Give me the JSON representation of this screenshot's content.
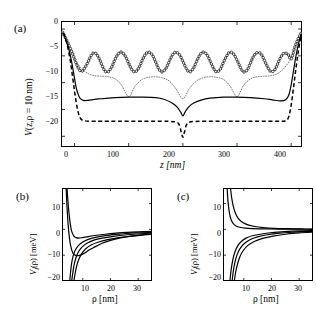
{
  "figure": {
    "panels": [
      {
        "tag": "(a)",
        "xlabel": "z [nm]",
        "ylabel_parts": {
          "v": "V",
          "args": "(z,ρ = 10 nm)"
        },
        "xticks": [
          "0",
          "100",
          "200",
          "300",
          "400"
        ],
        "yticks": [
          "0",
          "−5",
          "−10",
          "−15",
          "−20"
        ]
      },
      {
        "tag": "(b)",
        "xlabel": "ρ [nm]",
        "ylabel_parts": {
          "v": "V",
          "sub": "l",
          "args": "(ρ)",
          "unit": "[meV]"
        },
        "xticks": [
          "10",
          "20",
          "30"
        ],
        "yticks": [
          "10",
          "0",
          "−10",
          "−20"
        ],
        "annotation": "l=2…6"
      },
      {
        "tag": "(c)",
        "xlabel": "ρ [nm]",
        "ylabel_parts": {
          "v": "V",
          "sub": "l",
          "args": "(ρ)",
          "unit": "[meV]"
        },
        "xticks": [
          "10",
          "20",
          "30"
        ],
        "yticks": [
          "10",
          "0",
          "−10",
          "−20"
        ],
        "annotation": "l=2…6"
      }
    ]
  },
  "chart_data": [
    {
      "type": "line",
      "panel": "a",
      "title": "",
      "xlabel": "z [nm]",
      "ylabel": "V(z,ρ = 10 nm)",
      "xlim": [
        -25,
        420
      ],
      "ylim": [
        -22,
        1.5
      ],
      "xticks": [
        0,
        100,
        200,
        300,
        400
      ],
      "yticks": [
        0,
        -5,
        -10,
        -15,
        -20
      ],
      "grid": false,
      "legend": "none",
      "series": [
        {
          "name": "oscillating-circles",
          "style": "open-circle-markers",
          "comment": "8 oscillation periods of ~50 nm between z=0 and z=400, peaks near -4.3, troughs near -8.0; rises steeply to ~0 outside 0..400",
          "x": [
            -22,
            -18,
            -14,
            -10,
            -6,
            -2,
            0,
            6,
            12,
            18,
            25,
            31,
            37,
            44,
            50,
            56,
            62,
            69,
            75,
            81,
            87,
            94,
            100,
            106,
            112,
            119,
            125,
            131,
            137,
            144,
            150,
            156,
            162,
            169,
            175,
            181,
            187,
            194,
            200,
            206,
            212,
            219,
            225,
            231,
            237,
            244,
            250,
            256,
            262,
            269,
            275,
            281,
            287,
            294,
            300,
            306,
            312,
            319,
            325,
            331,
            337,
            344,
            350,
            356,
            362,
            369,
            375,
            381,
            387,
            394,
            400,
            406,
            412,
            418
          ],
          "y": [
            -0.6,
            -1.4,
            -2.2,
            -3.1,
            -4.0,
            -5.0,
            -5.6,
            -7.1,
            -7.9,
            -7.4,
            -6.1,
            -4.9,
            -4.4,
            -5.2,
            -6.6,
            -7.8,
            -8.0,
            -7.0,
            -5.6,
            -4.6,
            -4.3,
            -5.1,
            -6.4,
            -7.6,
            -8.0,
            -7.2,
            -5.8,
            -4.7,
            -4.3,
            -4.9,
            -6.2,
            -7.5,
            -8.0,
            -7.3,
            -6.0,
            -4.8,
            -4.3,
            -4.8,
            -6.0,
            -7.3,
            -8.0,
            -7.4,
            -6.1,
            -4.9,
            -4.3,
            -4.7,
            -5.9,
            -7.2,
            -8.0,
            -7.5,
            -6.2,
            -5.0,
            -4.3,
            -4.7,
            -5.8,
            -7.1,
            -8.0,
            -7.6,
            -6.3,
            -5.0,
            -4.4,
            -4.6,
            -5.7,
            -7.0,
            -7.9,
            -7.7,
            -6.5,
            -5.2,
            -4.5,
            -4.7,
            -5.6,
            -3.6,
            -2.0,
            -0.8
          ]
        },
        {
          "name": "fine-dotted-arches",
          "style": "fine-dotted",
          "comment": "four wide arches spanning 0..400 with cusps near z=100,200,300 descending to about -12.8 and peaks near -8.5",
          "x": [
            0,
            12,
            25,
            37,
            50,
            62,
            75,
            87,
            100,
            112,
            125,
            137,
            150,
            162,
            175,
            187,
            200,
            212,
            225,
            237,
            250,
            262,
            275,
            287,
            300,
            312,
            325,
            337,
            350,
            362,
            375,
            387,
            400
          ],
          "y": [
            -5.6,
            -7.3,
            -8.3,
            -8.7,
            -8.8,
            -8.9,
            -9.3,
            -10.5,
            -12.6,
            -10.6,
            -9.4,
            -9.0,
            -8.9,
            -9.1,
            -9.7,
            -11.1,
            -13.0,
            -11.1,
            -9.7,
            -9.1,
            -8.9,
            -9.0,
            -9.4,
            -10.6,
            -12.6,
            -10.5,
            -9.3,
            -8.9,
            -8.8,
            -8.7,
            -8.3,
            -7.3,
            -5.6
          ]
        },
        {
          "name": "solid-curve",
          "style": "solid",
          "comment": "flat broad well near -12.8 with a moderate V dip to about -16.2 at z=200, steep walls at z=0 and z=400",
          "x": [
            -22,
            -18,
            -14,
            -10,
            -6,
            -2,
            2,
            6,
            10,
            16,
            25,
            37,
            50,
            75,
            100,
            125,
            150,
            165,
            180,
            190,
            196,
            200,
            204,
            210,
            220,
            235,
            250,
            275,
            300,
            325,
            350,
            365,
            380,
            390,
            396,
            400,
            404,
            408,
            412,
            416,
            419
          ],
          "y": [
            -0.6,
            -1.5,
            -2.6,
            -4.0,
            -5.8,
            -8.0,
            -10.4,
            -12.0,
            -12.9,
            -13.3,
            -13.3,
            -13.1,
            -13.0,
            -12.8,
            -12.7,
            -12.7,
            -12.8,
            -13.1,
            -13.8,
            -14.6,
            -15.5,
            -16.2,
            -15.5,
            -14.6,
            -13.8,
            -13.2,
            -12.9,
            -12.7,
            -12.7,
            -12.8,
            -13.0,
            -13.2,
            -13.4,
            -13.2,
            -12.2,
            -10.4,
            -8.0,
            -5.5,
            -3.4,
            -1.8,
            -0.8
          ]
        },
        {
          "name": "dashed-curve",
          "style": "dashed",
          "comment": "flat plateau near -17.2 with a deep narrow spike to -20.2 at z=200",
          "x": [
            -20,
            -16,
            -12,
            -8,
            -4,
            0,
            4,
            8,
            12,
            18,
            30,
            50,
            80,
            120,
            160,
            185,
            193,
            197,
            200,
            203,
            207,
            215,
            240,
            280,
            320,
            360,
            385,
            392,
            396,
            400,
            404,
            408,
            412,
            416,
            419
          ],
          "y": [
            -0.8,
            -2.0,
            -3.6,
            -5.8,
            -8.6,
            -11.6,
            -14.2,
            -16.0,
            -16.8,
            -17.1,
            -17.2,
            -17.2,
            -17.2,
            -17.2,
            -17.2,
            -17.3,
            -17.8,
            -19.2,
            -20.2,
            -19.2,
            -17.8,
            -17.3,
            -17.2,
            -17.2,
            -17.2,
            -17.2,
            -17.2,
            -17.0,
            -16.2,
            -14.2,
            -11.2,
            -8.0,
            -5.0,
            -2.4,
            -1.0
          ]
        }
      ]
    },
    {
      "type": "line",
      "panel": "b",
      "title": "",
      "xlabel": "ρ [nm]",
      "ylabel": "V_l(ρ) [meV]",
      "xlim": [
        2.5,
        35
      ],
      "ylim": [
        -20,
        16
      ],
      "xticks": [
        10,
        20,
        30
      ],
      "yticks": [
        10,
        0,
        -10,
        -20
      ],
      "grid": false,
      "legend": "none",
      "annotation": "l=2…6",
      "series": [
        {
          "name": "well-curve-upper",
          "style": "solid",
          "comment": "repulsive core then shallow well approaching 0 from below",
          "x": [
            4.3,
            4.6,
            5.0,
            5.5,
            6.0,
            6.8,
            7.6,
            8.6,
            10,
            12,
            15,
            18,
            22,
            26,
            30,
            35
          ],
          "y": [
            16,
            11.5,
            6.5,
            2.0,
            -0.8,
            -2.6,
            -3.2,
            -3.4,
            -3.2,
            -2.8,
            -2.3,
            -1.9,
            -1.5,
            -1.2,
            -1.0,
            -0.8
          ]
        },
        {
          "name": "well-curve-deep",
          "style": "solid",
          "comment": "deep well reaching about -10 near rho=9 then rising toward 0",
          "x": [
            4.0,
            4.3,
            4.7,
            5.2,
            5.8,
            6.5,
            7.4,
            8.4,
            9.4,
            10.5,
            12,
            14,
            17,
            20,
            24,
            28,
            32,
            35
          ],
          "y": [
            16,
            9.0,
            2.0,
            -3.5,
            -7.2,
            -9.3,
            -10.1,
            -10.2,
            -9.9,
            -9.3,
            -8.2,
            -7.0,
            -5.4,
            -4.3,
            -3.2,
            -2.5,
            -2.0,
            -1.7
          ]
        },
        {
          "name": "divergent-curve-1",
          "style": "solid",
          "x": [
            5.3,
            5.6,
            6.0,
            6.6,
            7.4,
            8.5,
            10,
            12,
            15,
            19,
            24,
            29,
            35
          ],
          "y": [
            -20,
            -16.5,
            -13.0,
            -10.0,
            -7.8,
            -6.2,
            -4.9,
            -3.9,
            -3.0,
            -2.3,
            -1.8,
            -1.4,
            -1.2
          ]
        },
        {
          "name": "divergent-curve-2",
          "style": "solid",
          "x": [
            6.0,
            6.4,
            6.9,
            7.6,
            8.5,
            9.8,
            11.5,
            14,
            17,
            21,
            26,
            31,
            35
          ],
          "y": [
            -20,
            -16.8,
            -13.6,
            -10.8,
            -8.6,
            -6.8,
            -5.4,
            -4.2,
            -3.4,
            -2.7,
            -2.1,
            -1.7,
            -1.5
          ]
        },
        {
          "name": "divergent-curve-3",
          "style": "solid",
          "x": [
            6.8,
            7.2,
            7.8,
            8.5,
            9.5,
            11,
            13,
            15.5,
            19,
            23,
            28,
            33,
            35
          ],
          "y": [
            -20,
            -17.2,
            -14.2,
            -11.8,
            -9.6,
            -7.6,
            -6.1,
            -5.0,
            -4.0,
            -3.2,
            -2.6,
            -2.1,
            -2.0
          ]
        }
      ]
    },
    {
      "type": "line",
      "panel": "c",
      "title": "",
      "xlabel": "ρ [nm]",
      "ylabel": "V_l(ρ) [meV]",
      "xlim": [
        2.5,
        35
      ],
      "ylim": [
        -20,
        16
      ],
      "xticks": [
        10,
        20,
        30
      ],
      "yticks": [
        10,
        0,
        -10,
        -20
      ],
      "grid": false,
      "legend": "none",
      "annotation": "l=2…6",
      "series": [
        {
          "name": "repulsive-curve-1",
          "style": "solid",
          "comment": "steep repulsive branch decaying to 0 from above",
          "x": [
            5.2,
            5.6,
            6.2,
            7.0,
            8.0,
            9.5,
            11.5,
            14,
            17,
            21,
            26,
            31,
            35
          ],
          "y": [
            16,
            12.5,
            9.0,
            6.2,
            4.2,
            2.7,
            1.7,
            1.1,
            0.7,
            0.4,
            0.25,
            0.15,
            0.1
          ]
        },
        {
          "name": "repulsive-curve-2",
          "style": "solid",
          "x": [
            4.0,
            4.3,
            4.8,
            5.4,
            6.2,
            7.2,
            8.6,
            10.5,
            13,
            16,
            20,
            25,
            30,
            35
          ],
          "y": [
            16,
            11.0,
            6.5,
            3.8,
            2.2,
            1.3,
            0.8,
            0.5,
            0.3,
            0.2,
            0.12,
            0.08,
            0.05,
            0.03
          ]
        },
        {
          "name": "attractive-curve-1",
          "style": "solid",
          "x": [
            5.0,
            5.4,
            6.0,
            6.8,
            7.8,
            9.2,
            11,
            13.5,
            17,
            21,
            26,
            31,
            35
          ],
          "y": [
            -20,
            -16.0,
            -12.0,
            -8.8,
            -6.4,
            -4.6,
            -3.3,
            -2.4,
            -1.7,
            -1.2,
            -0.8,
            -0.6,
            -0.5
          ]
        },
        {
          "name": "attractive-curve-2",
          "style": "solid",
          "x": [
            5.8,
            6.2,
            6.8,
            7.6,
            8.7,
            10.2,
            12.2,
            15,
            18.5,
            23,
            28,
            33,
            35
          ],
          "y": [
            -20,
            -16.4,
            -12.8,
            -9.8,
            -7.4,
            -5.5,
            -4.0,
            -2.9,
            -2.1,
            -1.5,
            -1.1,
            -0.8,
            -0.75
          ]
        },
        {
          "name": "attractive-curve-3",
          "style": "solid",
          "x": [
            6.6,
            7.0,
            7.7,
            8.6,
            9.8,
            11.5,
            13.8,
            16.8,
            20.5,
            25,
            30,
            35
          ],
          "y": [
            -20,
            -17.0,
            -13.6,
            -10.6,
            -8.2,
            -6.2,
            -4.7,
            -3.5,
            -2.6,
            -1.9,
            -1.4,
            -1.1
          ]
        }
      ]
    }
  ]
}
